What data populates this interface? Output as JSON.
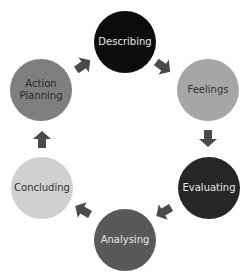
{
  "diagram": {
    "type": "cycle",
    "nodes": [
      {
        "label": "Describing",
        "x": 125,
        "y": 42,
        "fill": "#0d0d0d",
        "text": "#e6e6e6"
      },
      {
        "label": "Feelings",
        "x": 208,
        "y": 90,
        "fill": "#a6a6a6",
        "text": "#333333"
      },
      {
        "label": "Evaluating",
        "x": 209,
        "y": 188,
        "fill": "#262626",
        "text": "#e6e6e6"
      },
      {
        "label": "Analysing",
        "x": 125,
        "y": 240,
        "fill": "#595959",
        "text": "#e6e6e6"
      },
      {
        "label": "Concluding",
        "x": 42,
        "y": 188,
        "fill": "#d0d0d0",
        "text": "#333333"
      },
      {
        "label": "Action Planning",
        "x": 41,
        "y": 90,
        "fill": "#7f7f7f",
        "text": "#2a2a2a"
      }
    ],
    "arrow_color": "#4a4a4a"
  }
}
